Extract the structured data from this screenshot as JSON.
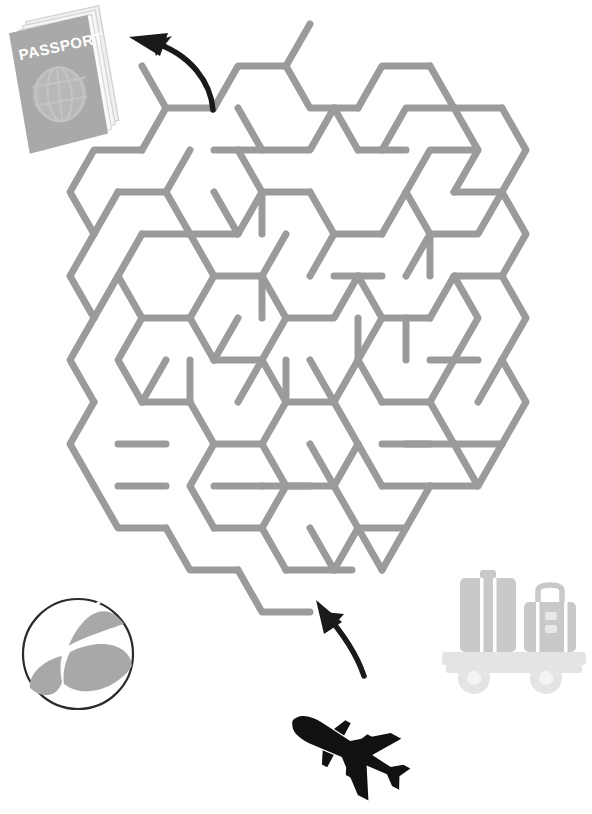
{
  "page": {
    "width": 592,
    "height": 814,
    "background_color": "#ffffff"
  },
  "colors": {
    "maze_wall": "#9b9b9b",
    "arrow": "#1a1a1a",
    "passport_cover": "#a8a8a8",
    "passport_pages": "#e8e8e8",
    "passport_globe": "#c2c2c2",
    "passport_text": "#ffffff",
    "ball_segment": "#a8a8a8",
    "ball_outline": "#2b2b2b",
    "ball_white": "#ffffff",
    "airplane": "#111111",
    "luggage_case": "#c9c9c9",
    "luggage_cart": "#e4e4e4",
    "luggage_strap": "#ffffff"
  },
  "maze": {
    "name": "hexagonal-maze",
    "cell_shape": "hexagon",
    "wall_color": "#9b9b9b",
    "wall_width": 7,
    "entrance": {
      "label": "Start",
      "x": 330,
      "y": 598,
      "side": "bottom"
    },
    "exit": {
      "label": "Finish",
      "x": 214,
      "y": 108,
      "side": "top-left"
    }
  },
  "decorations": {
    "passport": {
      "name": "passport",
      "label": "PASSPORT",
      "x": 8,
      "y": 6,
      "width": 104,
      "height": 142,
      "rotation": -6
    },
    "beach_ball": {
      "name": "beach-ball",
      "x": 22,
      "y": 598,
      "diameter": 112,
      "segments": 6
    },
    "airplane": {
      "name": "airplane",
      "x": 285,
      "y": 702,
      "width": 112,
      "height": 88,
      "rotation": 28
    },
    "luggage_cart": {
      "name": "luggage-cart",
      "x": 438,
      "y": 562,
      "width": 142,
      "height": 118,
      "suitcase_count": 2,
      "wheel_count": 2
    }
  },
  "arrows": {
    "exit_arrow": {
      "name": "exit-arrow",
      "description": "curved arrow pointing from maze exit to passport",
      "direction": "up-left"
    },
    "entrance_arrow": {
      "name": "entrance-arrow",
      "description": "curved arrow pointing from airplane into maze entrance",
      "direction": "up-left"
    }
  }
}
